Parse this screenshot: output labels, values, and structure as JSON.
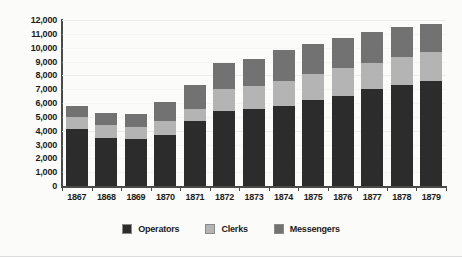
{
  "chart_data": {
    "type": "bar",
    "stacked": true,
    "title": "",
    "subtitle": "",
    "xlabel": "",
    "ylabel": "",
    "grid": true,
    "legend_position": "bottom",
    "ylim": [
      0,
      12000
    ],
    "ytick_step": 1000,
    "ytick_labels": [
      "0",
      "1,000",
      "2,000",
      "3,000",
      "4,000",
      "5,000",
      "6,000",
      "7,000",
      "8,000",
      "9,000",
      "10,000",
      "11,000",
      "12,000"
    ],
    "ytick_values": [
      0,
      1000,
      2000,
      3000,
      4000,
      5000,
      6000,
      7000,
      8000,
      9000,
      10000,
      11000,
      12000
    ],
    "categories": [
      "1867",
      "1868",
      "1869",
      "1870",
      "1871",
      "1872",
      "1873",
      "1874",
      "1875",
      "1876",
      "1877",
      "1878",
      "1879"
    ],
    "series": [
      {
        "name": "Operators",
        "color": "#2c2c2c",
        "values": [
          4100,
          3500,
          3400,
          3700,
          4700,
          5400,
          5600,
          5800,
          6200,
          6500,
          7000,
          7300,
          7600
        ]
      },
      {
        "name": "Clerks",
        "color": "#b4b4b4",
        "values": [
          900,
          900,
          900,
          1000,
          900,
          1600,
          1600,
          1800,
          1900,
          2000,
          1900,
          2000,
          2100
        ]
      },
      {
        "name": "Messengers",
        "color": "#727272",
        "values": [
          800,
          900,
          900,
          1400,
          1700,
          1900,
          2000,
          2200,
          2200,
          2200,
          2200,
          2200,
          2000
        ]
      }
    ],
    "totals": [
      5800,
      5300,
      5200,
      6100,
      7300,
      8900,
      9200,
      9800,
      10300,
      10700,
      11100,
      11500,
      11700
    ]
  },
  "legend": {
    "items": [
      {
        "label": "Operators",
        "color": "#2c2c2c"
      },
      {
        "label": "Clerks",
        "color": "#b4b4b4"
      },
      {
        "label": "Messengers",
        "color": "#727272"
      }
    ]
  }
}
